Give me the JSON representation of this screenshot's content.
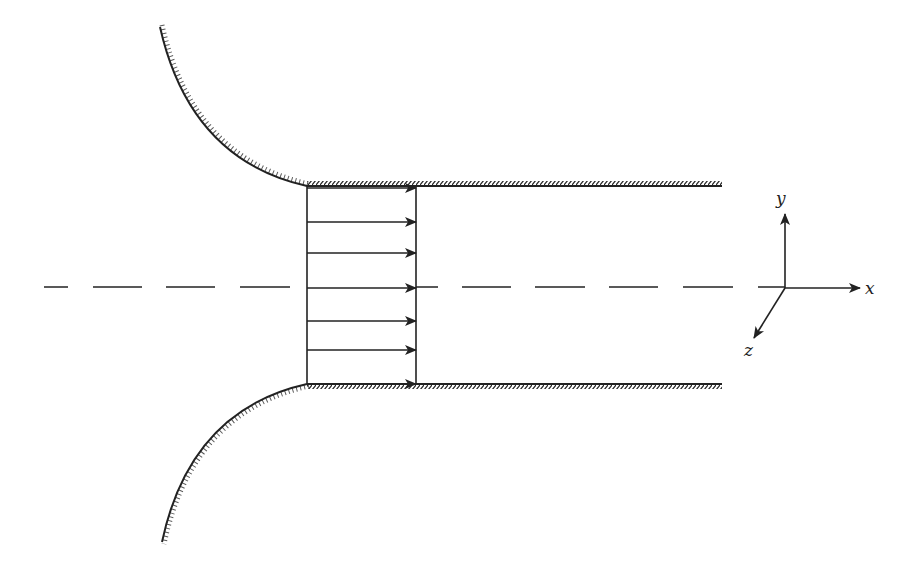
{
  "diagram": {
    "stroke_color": "#222222",
    "background": "#ffffff",
    "channel": {
      "inlet_x": 307,
      "top_wall_y": 186,
      "bottom_wall_y": 384,
      "wall_end_x": 722
    },
    "velocity_profile": {
      "type": "uniform",
      "profile_line_x": 416,
      "arrow_start_x": 307,
      "arrow_ys": [
        188,
        222,
        253,
        288,
        321,
        350,
        384
      ]
    },
    "centerline": {
      "y": 287,
      "start_x": 44,
      "end_x": 785,
      "style": "dashed"
    },
    "axes": {
      "origin": [
        785,
        288
      ],
      "x_label": "x",
      "y_label": "y",
      "z_label": "z"
    }
  }
}
